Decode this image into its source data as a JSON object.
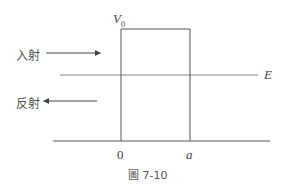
{
  "diagram": {
    "barrier_label": "V",
    "barrier_label_sub": "0",
    "energy_label": "E",
    "incident_label": "入射",
    "reflected_label": "反射",
    "x_origin_label": "0",
    "x_width_label": "a",
    "caption": "圖 7-10",
    "colors": {
      "line": "#555555",
      "text": "#444444"
    }
  }
}
